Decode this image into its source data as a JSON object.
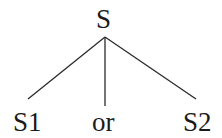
{
  "tree": {
    "root": {
      "label": "S"
    },
    "children": [
      {
        "label": "S1"
      },
      {
        "label": "or"
      },
      {
        "label": "S2"
      }
    ]
  }
}
